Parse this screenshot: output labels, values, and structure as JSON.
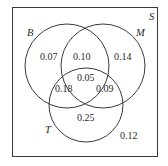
{
  "diagram": {
    "type": "venn",
    "universe_label": "S",
    "sets": [
      {
        "name": "B"
      },
      {
        "name": "M"
      },
      {
        "name": "T"
      }
    ],
    "regions": {
      "B_only": "0.07",
      "M_only": "0.14",
      "T_only": "0.25",
      "B_M_only": "0.10",
      "B_T_only": "0.18",
      "M_T_only": "0.09",
      "B_M_T": "0.05",
      "outside": "0.12"
    }
  }
}
